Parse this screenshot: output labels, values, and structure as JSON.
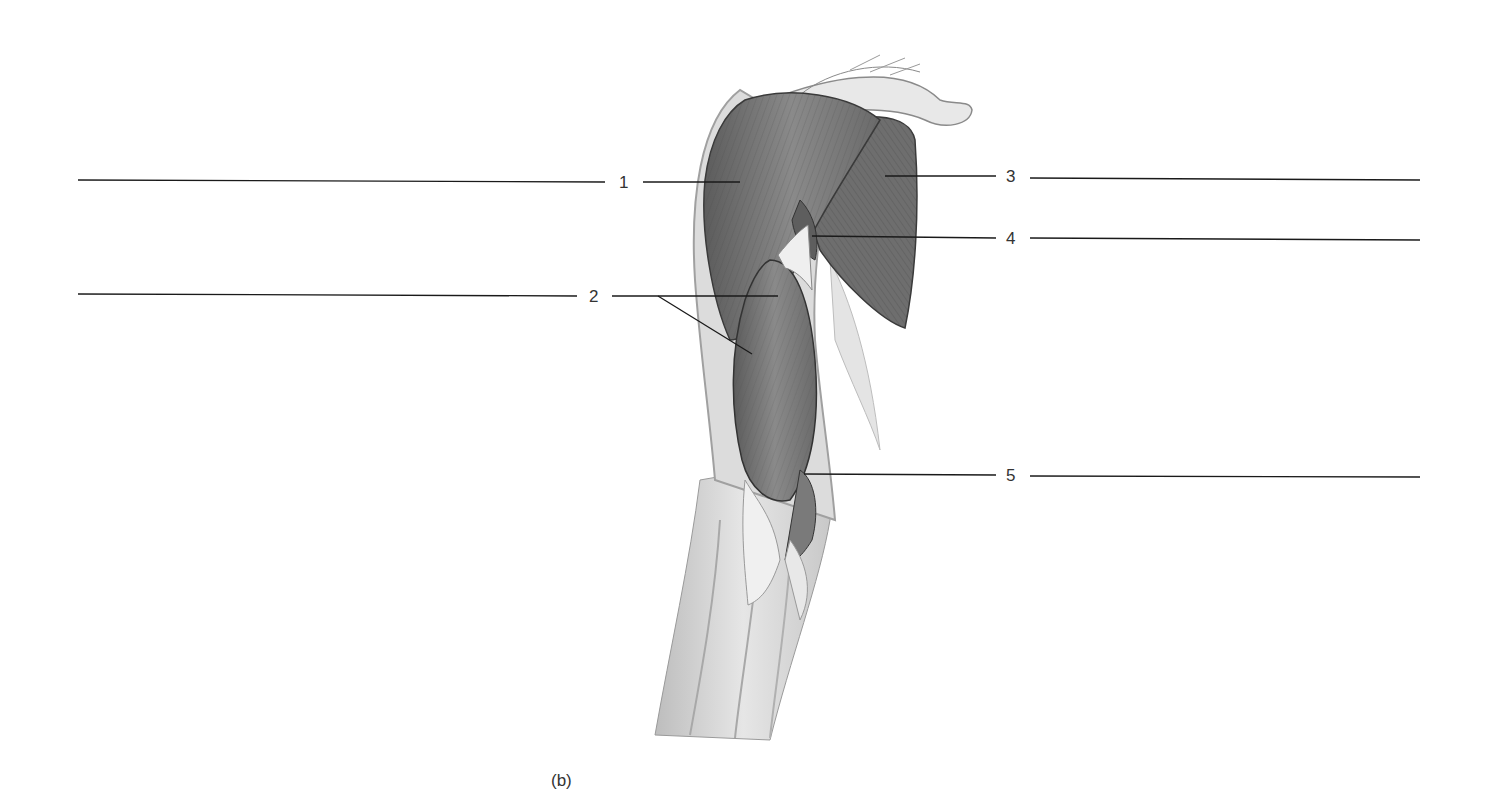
{
  "figure": {
    "caption": "(b)"
  },
  "labels": [
    {
      "id": 1,
      "text": "1",
      "side": "left"
    },
    {
      "id": 2,
      "text": "2",
      "side": "left"
    },
    {
      "id": 3,
      "text": "3",
      "side": "right"
    },
    {
      "id": 4,
      "text": "4",
      "side": "right"
    },
    {
      "id": 5,
      "text": "5",
      "side": "right"
    }
  ],
  "answer_blanks": [
    "",
    "",
    "",
    "",
    ""
  ],
  "colors": {
    "line": "#1a1a1a",
    "muscle_dark": "#6a6a6a",
    "muscle_mid": "#8c8c8c",
    "skin": "#d8d8d8",
    "tendon": "#ececec"
  }
}
